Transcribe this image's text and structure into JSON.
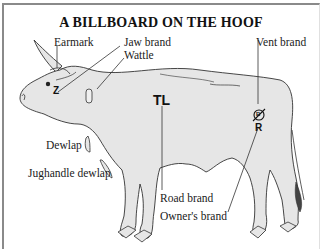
{
  "title": "A BILLBOARD ON THE HOOF",
  "labels": {
    "earmark": "Earmark",
    "jaw_brand": "Jaw brand",
    "wattle": "Wattle",
    "vent_brand": "Vent brand",
    "dewlap": "Dewlap",
    "jughandle_dewlap": "Jughandle dewlap",
    "road_brand": "Road brand",
    "owners_brand": "Owner's brand"
  },
  "brands": {
    "jaw": "Z",
    "road": "TL",
    "vent": "B",
    "owner": "R"
  },
  "colors": {
    "cow_fill": "#e6e6e6",
    "outline": "#333333",
    "frame": "#8a8a8a"
  }
}
